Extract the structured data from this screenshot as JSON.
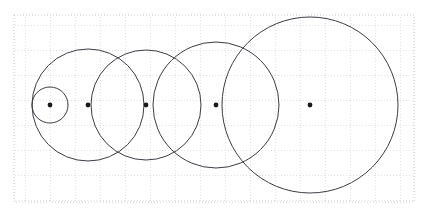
{
  "figure": {
    "title": "",
    "width": 427,
    "height": 217,
    "background_color": "#ffffff"
  },
  "grid": {
    "visible": true,
    "style": "dotted",
    "color": "#c8c8c8",
    "minor_color": "#e2e2e2",
    "cell_size": 25,
    "x_start": 14,
    "y_start": 15,
    "x_end": 414,
    "y_end": 202,
    "columns": 16,
    "rows": 7.5
  },
  "chart_data": {
    "type": "scatter",
    "title": "",
    "xlabel": "",
    "ylabel": "",
    "xlim": [
      14,
      414
    ],
    "ylim": [
      15,
      202
    ],
    "grid": true,
    "legend": false,
    "stroke_color": "#3c3c46",
    "point_color": "#1a1a1a",
    "baseline_y": 105,
    "circles": [
      {
        "label": "circle-1",
        "cx": 50,
        "cy": 105,
        "r": 18
      },
      {
        "label": "circle-2",
        "cx": 88,
        "cy": 105,
        "r": 56
      },
      {
        "label": "circle-3",
        "cx": 146,
        "cy": 105,
        "r": 55
      },
      {
        "label": "circle-4",
        "cx": 216,
        "cy": 105,
        "r": 63
      },
      {
        "label": "circle-5",
        "cx": 310,
        "cy": 105,
        "r": 88
      }
    ],
    "centers": [
      {
        "label": "center-1",
        "x": 50,
        "y": 105
      },
      {
        "label": "center-2",
        "x": 88,
        "y": 105
      },
      {
        "label": "center-3",
        "x": 146,
        "y": 105
      },
      {
        "label": "center-4",
        "x": 216,
        "y": 105
      },
      {
        "label": "center-5",
        "x": 310,
        "y": 105
      }
    ],
    "center_dot_radius": 2.4
  }
}
